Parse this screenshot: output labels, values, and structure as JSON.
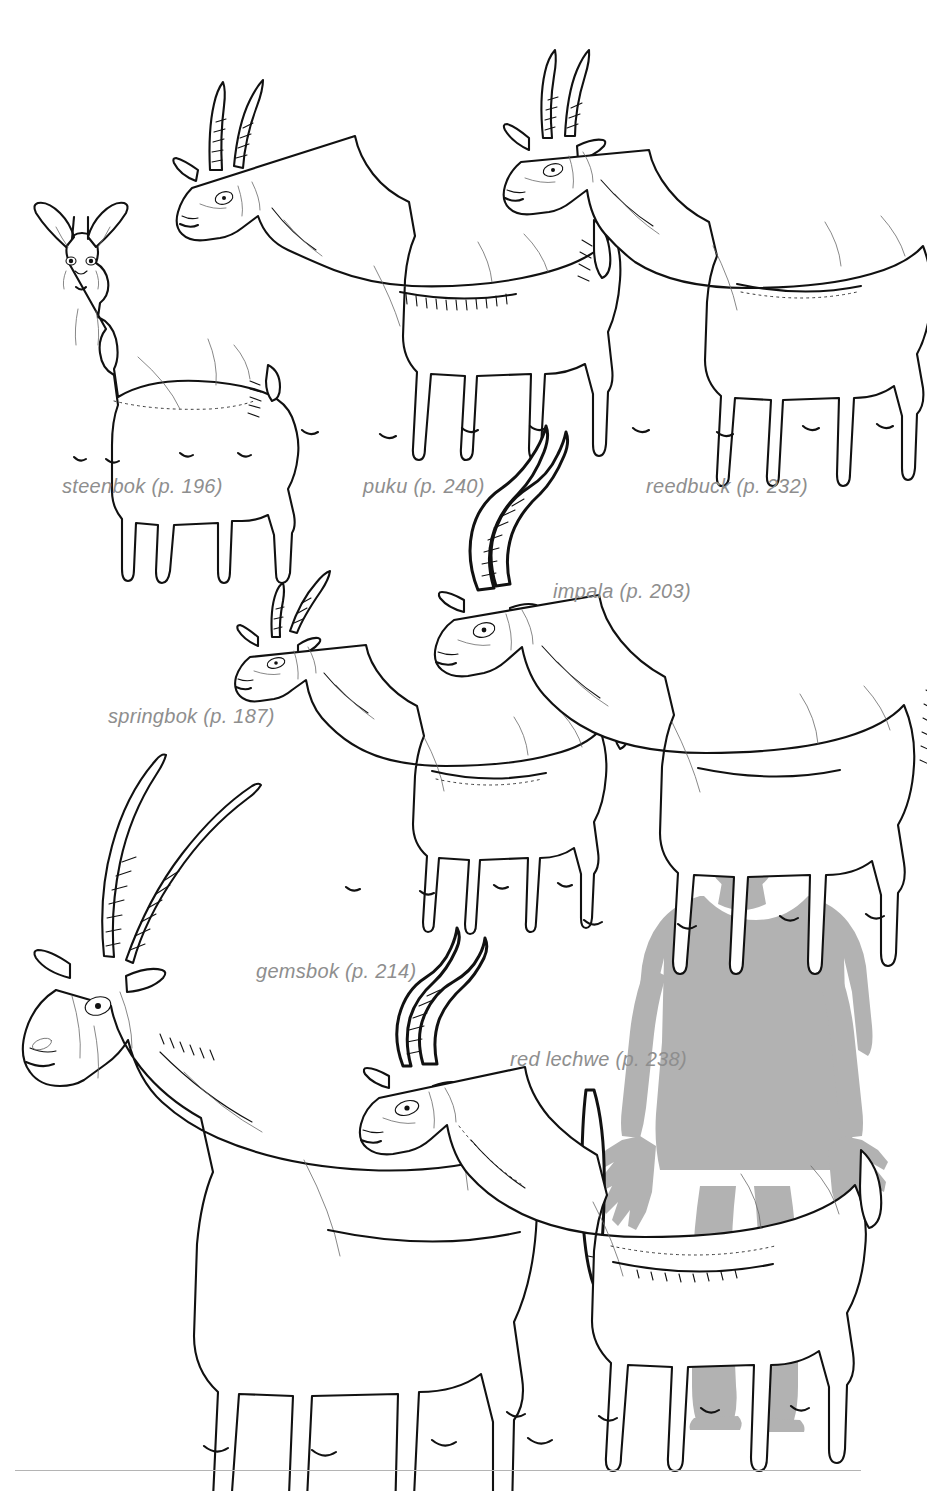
{
  "page": {
    "background_color": "#ffffff",
    "label_color": "#8e8e8e",
    "ink_color": "#111111",
    "silhouette_color": "#b2b2b2",
    "rule_color": "#b4b4b4",
    "kind": "field-guide-plate"
  },
  "labels": [
    {
      "id": "steenbok",
      "text": "steenbok (p. 196)",
      "species": "steenbok",
      "page_ref": "p. 196",
      "x": 62,
      "y": 475
    },
    {
      "id": "puku",
      "text": "puku (p. 240)",
      "species": "puku",
      "page_ref": "p. 240",
      "x": 363,
      "y": 475
    },
    {
      "id": "reedbuck",
      "text": "reedbuck (p. 232)",
      "species": "reedbuck",
      "page_ref": "p. 232",
      "x": 646,
      "y": 475
    },
    {
      "id": "impala",
      "text": "impala (p. 203)",
      "species": "impala",
      "page_ref": "p. 203",
      "x": 553,
      "y": 580
    },
    {
      "id": "springbok",
      "text": "springbok (p. 187)",
      "species": "springbok",
      "page_ref": "p. 187",
      "x": 108,
      "y": 705
    },
    {
      "id": "gemsbok",
      "text": "gemsbok (p. 214)",
      "species": "gemsbok",
      "page_ref": "p. 214",
      "x": 256,
      "y": 960
    },
    {
      "id": "red-lechwe",
      "text": "red lechwe (p. 238)",
      "species": "red lechwe",
      "page_ref": "p. 238",
      "x": 510,
      "y": 1048
    }
  ],
  "figures": [
    {
      "id": "steenbok-figure",
      "name": "steenbok drawing",
      "row": 1,
      "order": 1
    },
    {
      "id": "puku-figure",
      "name": "puku drawing",
      "row": 1,
      "order": 2
    },
    {
      "id": "reedbuck-figure",
      "name": "reedbuck drawing",
      "row": 1,
      "order": 3
    },
    {
      "id": "springbok-figure",
      "name": "springbok drawing",
      "row": 2,
      "order": 1
    },
    {
      "id": "impala-figure",
      "name": "impala drawing",
      "row": 2,
      "order": 2
    },
    {
      "id": "gemsbok-figure",
      "name": "gemsbok drawing",
      "row": 3,
      "order": 1
    },
    {
      "id": "red-lechwe-figure",
      "name": "red lechwe drawing",
      "row": 3,
      "order": 2
    },
    {
      "id": "human-silhouette",
      "name": "human scale silhouette",
      "row": 3,
      "order": 3
    }
  ]
}
